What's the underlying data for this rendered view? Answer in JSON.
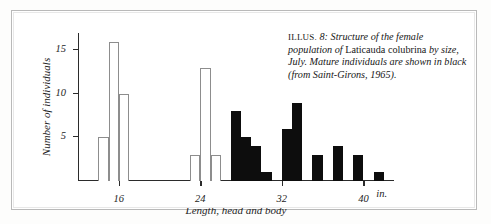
{
  "figure": {
    "caption": {
      "illus_tag": "ILLUS.",
      "number": "8:",
      "text_before_species": "Structure of the female population of",
      "species": "Laticauda colubrina",
      "text_after_species": "by size, July. Mature individuals are shown in black (from Saint-Girons, 1965).",
      "full": "ILLUS. 8: Structure of the female population of Laticauda colubrina by size, July. Mature individuals are shown in black (from Saint-Girons, 1965)."
    }
  },
  "chart_data": {
    "type": "bar",
    "title": "",
    "xlabel": "Length, head and body",
    "ylabel": "Number of individuals",
    "xunit": "in.",
    "xlim": [
      12,
      43
    ],
    "ylim": [
      0,
      17
    ],
    "xticks": [
      16,
      24,
      32,
      40
    ],
    "xtick_labels": [
      "16",
      "24",
      "32",
      "40"
    ],
    "yticks": [
      5,
      10,
      15
    ],
    "ytick_labels": [
      "5",
      "10",
      "15"
    ],
    "grid": false,
    "legend": "none",
    "bin_width": 1,
    "series": [
      {
        "name": "Immature",
        "color": "#ffffff",
        "edge_color": "#8d8d8d",
        "bars": [
          {
            "x": 14,
            "value": 5
          },
          {
            "x": 15,
            "value": 16
          },
          {
            "x": 16,
            "value": 10
          },
          {
            "x": 23,
            "value": 3
          },
          {
            "x": 24,
            "value": 13
          },
          {
            "x": 25,
            "value": 3
          }
        ]
      },
      {
        "name": "Mature",
        "color": "#0d0d0d",
        "edge_color": "#0d0d0d",
        "bars": [
          {
            "x": 27,
            "value": 8
          },
          {
            "x": 28,
            "value": 5
          },
          {
            "x": 29,
            "value": 4
          },
          {
            "x": 30,
            "value": 1
          },
          {
            "x": 32,
            "value": 6
          },
          {
            "x": 33,
            "value": 9
          },
          {
            "x": 35,
            "value": 3
          },
          {
            "x": 37,
            "value": 4
          },
          {
            "x": 39,
            "value": 3
          },
          {
            "x": 41,
            "value": 1
          }
        ]
      }
    ]
  }
}
